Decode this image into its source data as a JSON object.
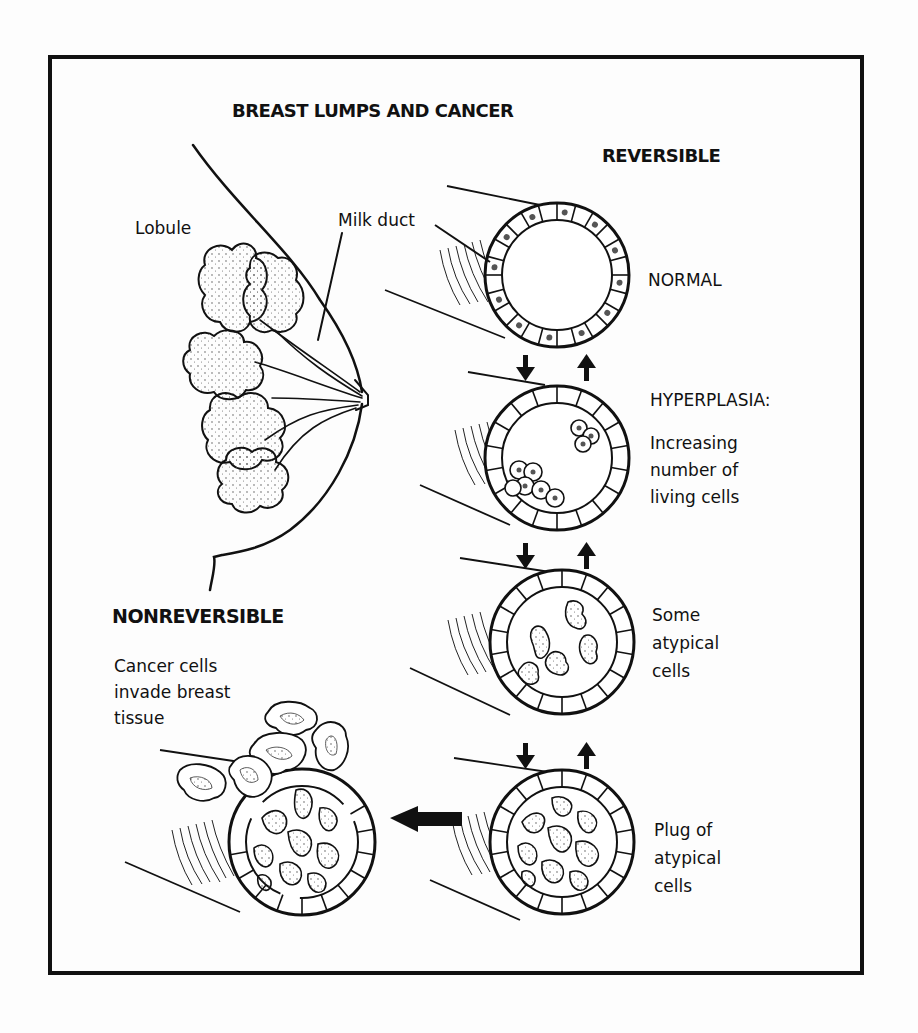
{
  "figure": {
    "title": "BREAST LUMPS AND CANCER",
    "sections": {
      "reversible": "REVERSIBLE",
      "nonreversible": "NONREVERSIBLE"
    },
    "anatomy_labels": {
      "lobule": "Lobule",
      "milk_duct": "Milk duct"
    },
    "stages": [
      {
        "name": "NORMAL",
        "description": ""
      },
      {
        "name": "HYPERPLASIA:",
        "description_lines": [
          "Increasing",
          "number of",
          "living cells"
        ]
      },
      {
        "name": "",
        "description_lines": [
          "Some",
          "atypical",
          "cells"
        ]
      },
      {
        "name": "",
        "description_lines": [
          "Plug of",
          "atypical",
          "cells"
        ]
      }
    ],
    "cancer_stage": {
      "description_lines": [
        "Cancer cells",
        "invade breast",
        "tissue"
      ]
    },
    "arrows": {
      "between_reversible_stages": [
        "down",
        "up"
      ],
      "to_nonreversible": "left"
    },
    "colors": {
      "ink": "#111111",
      "background": "#fdfdfd"
    }
  }
}
